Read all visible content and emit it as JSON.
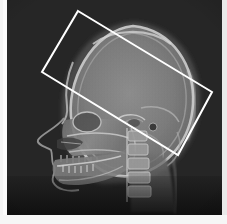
{
  "image": {
    "modality": "x-ray",
    "view": "lateral cephalogram",
    "subject": "human skull",
    "width_px": 227,
    "height_px": 224,
    "background_color": "#262626",
    "bone_color": "#b4b4b4",
    "soft_tissue_color": "#6a6a6a"
  },
  "annotation": {
    "type": "rotated-rectangle-roi",
    "stroke_color": "#ffffff",
    "stroke_width_px": 2,
    "rotation_deg": -19.5,
    "corners": [
      {
        "name": "top-left",
        "x": 78,
        "y": 11
      },
      {
        "name": "top-right",
        "x": 212,
        "y": 92
      },
      {
        "name": "bottom-right",
        "x": 178,
        "y": 155
      },
      {
        "name": "bottom-left",
        "x": 42,
        "y": 72
      }
    ],
    "label": ""
  },
  "frame": {
    "left_margin_color": "#f9f9f9",
    "right_margin_color": "#e9e9e9",
    "bottom_margin_color": "#f6f6f6"
  },
  "anatomy": {
    "regions": [
      {
        "name": "cranial-vault",
        "label": "Cranial vault"
      },
      {
        "name": "frontal-bone",
        "label": "Frontal bone"
      },
      {
        "name": "occipital-bone",
        "label": "Occipital bone"
      },
      {
        "name": "facial-profile",
        "label": "Soft tissue profile"
      },
      {
        "name": "orbit",
        "label": "Orbit"
      },
      {
        "name": "nasal-cavity",
        "label": "Nasal cavity"
      },
      {
        "name": "maxilla",
        "label": "Maxilla"
      },
      {
        "name": "mandible",
        "label": "Mandible"
      },
      {
        "name": "upper-teeth",
        "label": "Maxillary dentition"
      },
      {
        "name": "lower-teeth",
        "label": "Mandibular dentition"
      },
      {
        "name": "cervical-spine",
        "label": "Cervical vertebrae"
      },
      {
        "name": "sella-turcica",
        "label": "Sella turcica"
      },
      {
        "name": "external-auditory-meatus",
        "label": "External auditory meatus"
      }
    ]
  }
}
